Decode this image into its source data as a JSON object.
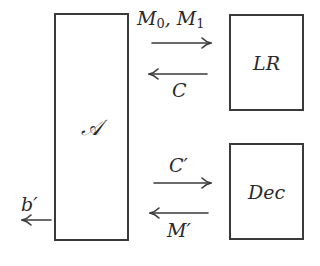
{
  "diagram": {
    "type": "security-game-reduction",
    "nodes": {
      "adversary": {
        "label": "𝒜"
      },
      "lr_oracle": {
        "label": "LR"
      },
      "dec_oracle": {
        "label": "Dec"
      }
    },
    "edges": [
      {
        "from": "adversary",
        "to": "lr_oracle",
        "label_main": "M",
        "label_sub0": "0",
        "label_sep": ", ",
        "label_main2": "M",
        "label_sub1": "1"
      },
      {
        "from": "lr_oracle",
        "to": "adversary",
        "label": "C"
      },
      {
        "from": "adversary",
        "to": "dec_oracle",
        "label": "C′"
      },
      {
        "from": "dec_oracle",
        "to": "adversary",
        "label": "M′"
      },
      {
        "from": "adversary",
        "to": "output",
        "label": "b′"
      }
    ],
    "colors": {
      "stroke": "#3a3a3a",
      "text": "#2a2a2a",
      "background": "#ffffff"
    }
  }
}
